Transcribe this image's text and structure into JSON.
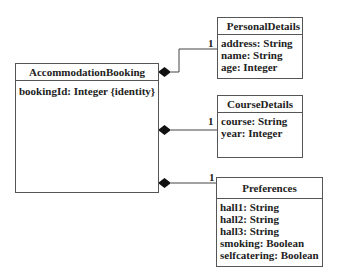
{
  "diagram": {
    "type": "UML class diagram",
    "classes": {
      "main": {
        "name": "AccommodationBooking",
        "attributes": [
          "bookingId: Integer {identity}"
        ]
      },
      "personal": {
        "name": "PersonalDetails",
        "attributes": [
          "address: String",
          "name: String",
          "age: Integer"
        ]
      },
      "course": {
        "name": "CourseDetails",
        "attributes": [
          "course: String",
          "year: Integer"
        ]
      },
      "prefs": {
        "name": "Preferences",
        "attributes": [
          "hall1: String",
          "hall2: String",
          "hall3: String",
          "smoking: Boolean",
          "selfcatering: Boolean"
        ]
      }
    },
    "relationships": [
      {
        "type": "composition",
        "from": "AccommodationBooking",
        "to": "PersonalDetails",
        "multiplicity": "1"
      },
      {
        "type": "composition",
        "from": "AccommodationBooking",
        "to": "CourseDetails",
        "multiplicity": "1"
      },
      {
        "type": "composition",
        "from": "AccommodationBooking",
        "to": "Preferences",
        "multiplicity": "1"
      }
    ]
  }
}
